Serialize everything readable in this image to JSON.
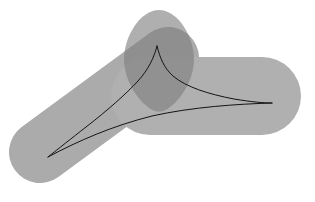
{
  "figure": {
    "canvas": {
      "width": 315,
      "height": 202,
      "background": "#ffffff"
    },
    "title": "",
    "caption": "",
    "colors": {
      "background": "#ffffff",
      "bar_light": "#ababab",
      "bar_light_alt": "#b0b0b0",
      "overlap_dark": "#8f8f8f",
      "egg_dark": "#8a8a8a",
      "curve_stroke": "#141414"
    }
  },
  "chart_data": {
    "type": "scatter",
    "title": "",
    "xlabel": "",
    "ylabel": "",
    "xlim": [
      0,
      315
    ],
    "ylim": [
      0,
      202
    ],
    "grid": false,
    "legend": null,
    "shapes": [
      {
        "name": "lower-left-bar",
        "kind": "rounded-bar",
        "fill": "#ababab",
        "opacity": 1,
        "x1": 40,
        "y1": 152,
        "x2": 168,
        "y2": 58,
        "thickness": 62,
        "cap": "round"
      },
      {
        "name": "upper-right-bar",
        "kind": "rounded-bar",
        "fill": "#b0b0b0",
        "opacity": 1,
        "x1": 150,
        "y1": 96,
        "x2": 262,
        "y2": 96,
        "thickness": 78,
        "cap": "round"
      },
      {
        "name": "dark-egg",
        "kind": "egg",
        "fill": "#7e7e7e",
        "opacity": 0.62,
        "cx": 159,
        "cy": 60,
        "rx": 35,
        "ry": 50,
        "taper": 0.72
      }
    ],
    "curve": {
      "name": "cusp-curve",
      "stroke": "#141414",
      "stroke_width": 1,
      "cusp_point": [
        157,
        46
      ],
      "branches": [
        {
          "name": "left-branch",
          "points": [
            [
              157,
              46
            ],
            [
              150,
              62
            ],
            [
              138,
              80
            ],
            [
              120,
              98
            ],
            [
              96,
              118
            ],
            [
              72,
              138
            ],
            [
              48,
              157
            ]
          ]
        },
        {
          "name": "right-branch",
          "points": [
            [
              157,
              46
            ],
            [
              163,
              60
            ],
            [
              172,
              72
            ],
            [
              188,
              83
            ],
            [
              212,
              92
            ],
            [
              242,
              99
            ],
            [
              272,
              103
            ]
          ]
        },
        {
          "name": "lower-chord",
          "points": [
            [
              48,
              157
            ],
            [
              86,
              136
            ],
            [
              124,
              122
            ],
            [
              166,
              112
            ],
            [
              212,
              106
            ],
            [
              272,
              103
            ]
          ]
        }
      ]
    }
  }
}
